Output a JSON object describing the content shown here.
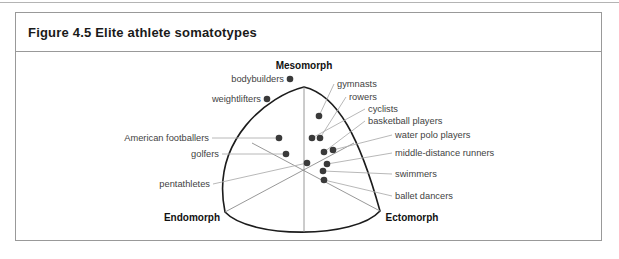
{
  "figure": {
    "title": "Figure 4.5 Elite athlete somatotypes"
  },
  "colors": {
    "panel_border": "#999999",
    "top_rule": "#b4b4b4",
    "triangle_outline": "#1c1c1c",
    "axis_line": "#8c8c8c",
    "leader_line": "#b0b0b0",
    "dot": "#3a3a3a",
    "label_text": "#3f3f3f"
  },
  "chart_data": {
    "type": "scatter",
    "variant": "somatochart-ternary",
    "title": "Figure 4.5 Elite athlete somatotypes",
    "axes_labels": [
      "Mesomorph",
      "Endomorph",
      "Ectomorph"
    ],
    "grid": false,
    "legend": false,
    "vertices": [
      {
        "label": "Mesomorph",
        "vx": 288,
        "vy": 35,
        "label_x": 288,
        "label_y": 13
      },
      {
        "label": "Endomorph",
        "vx": 209,
        "vy": 160,
        "label_x": 176,
        "label_y": 165
      },
      {
        "label": "Ectomorph",
        "vx": 364,
        "vy": 159,
        "label_x": 396,
        "label_y": 165
      }
    ],
    "points": [
      {
        "label": "bodybuilders",
        "x": 274,
        "y": 27,
        "side": "inline",
        "lx": 268,
        "ly": 27
      },
      {
        "label": "weightlifters",
        "x": 251,
        "y": 47,
        "side": "inline",
        "lx": 245,
        "ly": 47
      },
      {
        "label": "gymnasts",
        "x": 303,
        "y": 64,
        "side": "right",
        "lx": 321,
        "ly": 32
      },
      {
        "label": "rowers",
        "x": 304,
        "y": 86,
        "side": "right",
        "lx": 333,
        "ly": 45
      },
      {
        "label": "cyclists",
        "x": 296,
        "y": 86,
        "side": "right",
        "lx": 352,
        "ly": 57
      },
      {
        "label": "basketball players",
        "x": 308,
        "y": 100,
        "side": "right",
        "lx": 352,
        "ly": 69
      },
      {
        "label": "water polo players",
        "x": 317,
        "y": 98,
        "side": "right",
        "lx": 379,
        "ly": 83
      },
      {
        "label": "middle-distance runners",
        "x": 311,
        "y": 112,
        "side": "right",
        "lx": 379,
        "ly": 101
      },
      {
        "label": "swimmers",
        "x": 307,
        "y": 119,
        "side": "right",
        "lx": 379,
        "ly": 122
      },
      {
        "label": "ballet dancers",
        "x": 308,
        "y": 128,
        "side": "right",
        "lx": 379,
        "ly": 144
      },
      {
        "label": "American footballers",
        "x": 263,
        "y": 86,
        "side": "left",
        "lx": 193,
        "ly": 86
      },
      {
        "label": "golfers",
        "x": 270,
        "y": 102,
        "side": "left",
        "lx": 203,
        "ly": 102
      },
      {
        "label": "pentathletes",
        "x": 291,
        "y": 111,
        "side": "left",
        "lx": 194,
        "ly": 132
      }
    ]
  }
}
